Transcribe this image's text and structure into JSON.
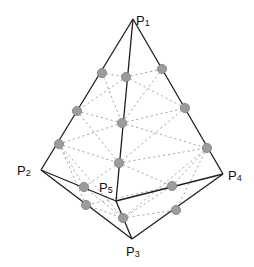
{
  "diagram": {
    "type": "polyhedron-mesh",
    "vertices": [
      {
        "id": "P1",
        "label": "P",
        "sub": "1",
        "x": 133,
        "y": 19,
        "lx": 136,
        "ly": 25
      },
      {
        "id": "P2",
        "label": "P",
        "sub": "2",
        "x": 41,
        "y": 170,
        "lx": 17,
        "ly": 175
      },
      {
        "id": "P3",
        "label": "P",
        "sub": "3",
        "x": 132,
        "y": 239,
        "lx": 126,
        "ly": 256
      },
      {
        "id": "P4",
        "label": "P",
        "sub": "4",
        "x": 223,
        "y": 174,
        "lx": 228,
        "ly": 180
      },
      {
        "id": "P5",
        "label": "P",
        "sub": "5",
        "x": 116,
        "y": 201,
        "lx": 99,
        "ly": 192
      }
    ],
    "solid_edges": [
      [
        "P1",
        "P2"
      ],
      [
        "P1",
        "P4"
      ],
      [
        "P1",
        "P5"
      ],
      [
        "P2",
        "P3"
      ],
      [
        "P2",
        "P5"
      ],
      [
        "P5",
        "P3"
      ],
      [
        "P5",
        "P4"
      ],
      [
        "P3",
        "P4"
      ]
    ],
    "nodes": [
      {
        "x": 102,
        "y": 73
      },
      {
        "x": 126,
        "y": 77
      },
      {
        "x": 162,
        "y": 69
      },
      {
        "x": 77,
        "y": 111
      },
      {
        "x": 122,
        "y": 123
      },
      {
        "x": 185,
        "y": 108
      },
      {
        "x": 59,
        "y": 144
      },
      {
        "x": 119,
        "y": 163
      },
      {
        "x": 207,
        "y": 148
      },
      {
        "x": 84,
        "y": 187
      },
      {
        "x": 172,
        "y": 186
      },
      {
        "x": 86,
        "y": 205
      },
      {
        "x": 123,
        "y": 218
      },
      {
        "x": 176,
        "y": 210
      }
    ],
    "dotted_edges": [
      [
        102,
        73,
        126,
        77
      ],
      [
        126,
        77,
        162,
        69
      ],
      [
        126,
        77,
        185,
        108
      ],
      [
        126,
        77,
        77,
        111
      ],
      [
        162,
        69,
        122,
        123
      ],
      [
        102,
        73,
        122,
        123
      ],
      [
        77,
        111,
        122,
        123
      ],
      [
        122,
        123,
        185,
        108
      ],
      [
        77,
        111,
        119,
        163
      ],
      [
        185,
        108,
        119,
        163
      ],
      [
        122,
        123,
        59,
        144
      ],
      [
        122,
        123,
        207,
        148
      ],
      [
        59,
        144,
        119,
        163
      ],
      [
        119,
        163,
        207,
        148
      ],
      [
        59,
        144,
        84,
        187
      ],
      [
        59,
        144,
        123,
        218
      ],
      [
        119,
        163,
        84,
        187
      ],
      [
        119,
        163,
        172,
        186
      ],
      [
        207,
        148,
        172,
        186
      ],
      [
        207,
        148,
        123,
        218
      ],
      [
        84,
        187,
        123,
        218
      ],
      [
        123,
        218,
        172,
        186
      ],
      [
        86,
        205,
        123,
        218
      ],
      [
        123,
        218,
        176,
        210
      ],
      [
        59,
        144,
        86,
        205
      ],
      [
        207,
        148,
        176,
        210
      ],
      [
        172,
        186,
        86,
        205
      ]
    ]
  }
}
